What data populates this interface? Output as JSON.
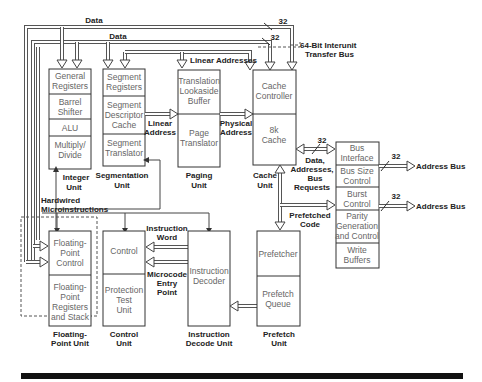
{
  "diagram": {
    "buses": {
      "data_top": "Data",
      "data_second": "Data",
      "linear_addresses": "Linear Addresses",
      "width_32_a": "32",
      "width_32_b": "32",
      "interunit_bus_line1": "64-Bit Interunit",
      "interunit_bus_line2": "Transfer Bus"
    },
    "units": {
      "integer": {
        "blocks": [
          [
            "General",
            "Registers"
          ],
          [
            "Barrel",
            "Shifter"
          ],
          [
            "ALU"
          ],
          [
            "Multiply/",
            "Divide"
          ]
        ],
        "label": [
          "Integer",
          "Unit"
        ]
      },
      "segmentation": {
        "blocks": [
          [
            "Segment",
            "Registers"
          ],
          [
            "Segment",
            "Descriptor",
            "Cache"
          ],
          [
            "Segment",
            "Translator"
          ]
        ],
        "label": [
          "Segmentation",
          "Unit"
        ]
      },
      "paging": {
        "blocks": [
          [
            "Translation",
            "Lookaside",
            "Buffer"
          ],
          [
            "Page",
            "Translator"
          ]
        ],
        "label": [
          "Paging",
          "Unit"
        ]
      },
      "cache": {
        "blocks": [
          [
            "Cache",
            "Controller"
          ],
          [
            "8k",
            "Cache"
          ]
        ],
        "label": [
          "Cache",
          "Unit"
        ]
      },
      "bus_interface": {
        "blocks": [
          [
            "Bus",
            "Interface"
          ],
          [
            "Bus Size",
            "Control"
          ],
          [
            "Burst",
            "Control"
          ],
          [
            "Parity",
            "Generation",
            "and Control"
          ],
          [
            "Write",
            "Buffers"
          ]
        ]
      },
      "floating_point": {
        "blocks": [
          [
            "Floating-",
            "Point",
            "Control"
          ],
          [
            "Floating-",
            "Point",
            "Registers",
            "and Stack"
          ]
        ],
        "label": [
          "Floating-",
          "Point Unit"
        ]
      },
      "control": {
        "blocks": [
          [
            "Control"
          ],
          [
            "Protection",
            "Test",
            "Unit"
          ]
        ],
        "label": [
          "Control",
          "Unit"
        ]
      },
      "instruction_decode": {
        "blocks": [
          [
            "Instruction",
            "Decoder"
          ]
        ],
        "label": [
          "Instruction",
          "Decode Unit"
        ]
      },
      "prefetch": {
        "blocks": [
          [
            "Prefetcher"
          ],
          [
            "Prefetch",
            "Queue"
          ]
        ],
        "label": [
          "Prefetch",
          "Unit"
        ]
      }
    },
    "signals": {
      "linear_address": [
        "Linear",
        "Address"
      ],
      "physical_address": [
        "Physical",
        "Address"
      ],
      "data_addr_bus_req": [
        "Data,",
        "Addresses,",
        "Bus",
        "Requests"
      ],
      "data_addr_width": "32",
      "prefetched_code": [
        "Prefetched",
        "Code"
      ],
      "hardwired": "Hardwired",
      "microinstructions": "Microinstructions",
      "instruction_word": [
        "Instruction",
        "Word"
      ],
      "microcode_entry": [
        "Microcode",
        "Entry",
        "Point"
      ],
      "address_bus_1": "Address Bus",
      "address_bus_1_width": "32",
      "address_bus_2": "Address Bus",
      "address_bus_2_width": "32"
    }
  }
}
